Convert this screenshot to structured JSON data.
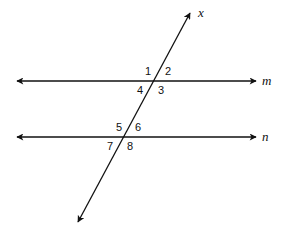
{
  "diagram": {
    "lines": {
      "transversal": {
        "label": "x",
        "x1": 78,
        "y1": 222,
        "x2": 190,
        "y2": 13
      },
      "m": {
        "label": "m",
        "x1": 17,
        "y1": 81,
        "x2": 256,
        "y2": 81
      },
      "n": {
        "label": "n",
        "x1": 17,
        "y1": 137,
        "x2": 256,
        "y2": 137
      }
    },
    "angles": [
      {
        "label": "1",
        "x": 145,
        "y": 75
      },
      {
        "label": "2",
        "x": 165,
        "y": 75
      },
      {
        "label": "4",
        "x": 137,
        "y": 94
      },
      {
        "label": "3",
        "x": 158,
        "y": 94
      },
      {
        "label": "5",
        "x": 116,
        "y": 131
      },
      {
        "label": "6",
        "x": 135,
        "y": 131
      },
      {
        "label": "7",
        "x": 107,
        "y": 150
      },
      {
        "label": "8",
        "x": 127,
        "y": 150
      }
    ],
    "colors": {
      "stroke": "#111111",
      "background": "#ffffff"
    }
  }
}
